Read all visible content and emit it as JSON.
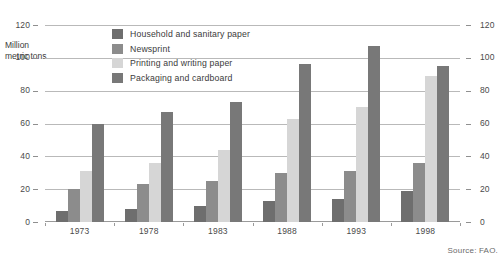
{
  "chart_data": {
    "type": "bar",
    "title": "",
    "subtitle": "",
    "xlabel": "",
    "ylabel": "Million metric tons",
    "ylabel_lines": [
      "Million",
      "metric tons"
    ],
    "categories": [
      "1973",
      "1978",
      "1983",
      "1988",
      "1993",
      "1998"
    ],
    "ylim": [
      0,
      120
    ],
    "yticks": [
      0,
      20,
      40,
      60,
      80,
      100,
      120
    ],
    "ytick_labels": [
      "0",
      "20",
      "40",
      "60",
      "80",
      "100",
      "120"
    ],
    "y_axis_both_sides": true,
    "grid": true,
    "legend_position": "inside-top-left",
    "series": [
      {
        "name": "Household and sanitary paper",
        "color": "#6e6e6e",
        "values": [
          7,
          8,
          10,
          13,
          14,
          19
        ]
      },
      {
        "name": "Newsprint",
        "color": "#8c8c8c",
        "values": [
          20,
          23,
          25,
          30,
          31,
          36
        ]
      },
      {
        "name": "Printing and writing paper",
        "color": "#d6d6d6",
        "values": [
          31,
          36,
          44,
          63,
          70,
          89
        ]
      },
      {
        "name": "Packaging and cardboard",
        "color": "#787878",
        "values": [
          60,
          67,
          73,
          96,
          107,
          95
        ]
      }
    ],
    "annotations": [
      "Source: FAO."
    ]
  },
  "footer": {
    "source": "Source: FAO."
  },
  "colors": {
    "household": "#6e6e6e",
    "newsprint": "#8c8c8c",
    "printing": "#d6d6d6",
    "packaging": "#787878",
    "gridline": "#b9b9b9",
    "text": "#3b3b3b",
    "background": "#ffffff"
  }
}
